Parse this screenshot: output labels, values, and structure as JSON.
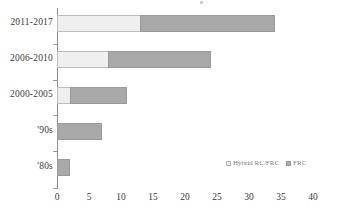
{
  "chart_data": {
    "type": "bar",
    "orientation": "horizontal",
    "stacked": true,
    "title": "",
    "xlabel": "",
    "ylabel": "",
    "categories": [
      "'80s",
      "'90s",
      "2000-2005",
      "2006-2010",
      "2011-2017"
    ],
    "series": [
      {
        "name": "Hybrid RC/FRC",
        "color": "#efefef",
        "values": [
          0,
          0,
          2,
          8,
          13
        ]
      },
      {
        "name": "FRC",
        "color": "#a8a8a8",
        "values": [
          2,
          7,
          9,
          16,
          21
        ]
      }
    ],
    "totals": [
      2,
      7,
      11,
      24,
      34
    ],
    "xlim": [
      0,
      40
    ],
    "xticks": [
      0,
      5,
      10,
      15,
      20,
      25,
      30,
      35,
      40
    ],
    "xtick_labels": [
      "0",
      "5",
      "10",
      "15",
      "20",
      "25",
      "30",
      "35",
      "40"
    ],
    "grid": false,
    "legend_position": "inside-bottom-right"
  },
  "legend": {
    "items": [
      {
        "label": "Hybrid RC/FRC",
        "swatch": "hybrid-swatch"
      },
      {
        "label": "FRC",
        "swatch": "frc-swatch"
      }
    ]
  },
  "y_axis": {
    "labels": [
      "2011-2017",
      "2006-2010",
      "2000-2005",
      "'90s",
      "'80s"
    ]
  }
}
